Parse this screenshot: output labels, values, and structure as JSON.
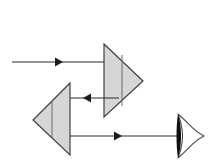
{
  "diagram": {
    "canvas": {
      "width": 209,
      "height": 163,
      "background": "#ffffff"
    },
    "colors": {
      "prism_fill": "#d6d6d6",
      "prism_stroke": "#3a3a3a",
      "prism_inner_line": "#6a6a6a",
      "ray_stroke": "#2b2b2b",
      "lens_outline": "#4a4a4a",
      "lens_core": "#101010",
      "background": "#ffffff"
    },
    "elements": {
      "upper_prism": {
        "label": "upper-prism",
        "orientation": "points-right",
        "points": "104,44 143,81 104,117",
        "inner_line": {
          "x1": 122,
          "y1": 55,
          "x2": 122,
          "y2": 106
        }
      },
      "lower_prism": {
        "label": "lower-prism",
        "orientation": "points-left",
        "points": "70,83 33,120 70,155",
        "inner_line": {
          "x1": 52,
          "y1": 101,
          "x2": 52,
          "y2": 138
        }
      },
      "concave_lens": {
        "label": "concave-lens",
        "outline_path": "M 178,114 C 190,124 192,130 204,136 C 192,142 190,148 178,158 C 184,142 184,130 178,114 Z",
        "core_path": "M 178,114 C 182,126 182,146 178,158 C 176,146 176,126 178,114 Z"
      }
    },
    "rays": [
      {
        "name": "incoming-ray-top",
        "direction": "right",
        "y": 62,
        "x_start": 12,
        "x_end": 104,
        "arrow_tip_x": 62,
        "line": {
          "x1": 12,
          "y1": 62,
          "x2": 104,
          "y2": 62
        },
        "head": "55,57.5 63,62 55,66.5"
      },
      {
        "name": "middle-ray-leftward",
        "direction": "left",
        "y": 98,
        "x_start": 119,
        "x_end": 70,
        "arrow_tip_x": 84,
        "line": {
          "x1": 119,
          "y1": 98,
          "x2": 70,
          "y2": 98
        },
        "head": "91,93.5 83,98 91,102.5"
      },
      {
        "name": "outgoing-ray-bottom",
        "direction": "right",
        "y": 136,
        "x_start": 70,
        "x_end": 179,
        "arrow_tip_x": 122,
        "line": {
          "x1": 70,
          "y1": 136,
          "x2": 179,
          "y2": 136
        },
        "head": "114,131.5 122,136 114,140.5"
      }
    ]
  }
}
